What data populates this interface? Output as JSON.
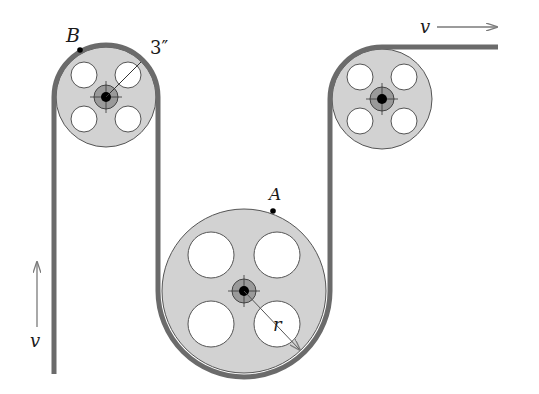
{
  "diagram": {
    "type": "belt-pulley-system",
    "labels": {
      "point_b": "B",
      "point_a": "A",
      "small_radius": "3″",
      "large_radius": "r",
      "velocity_out": "v",
      "velocity_in": "v"
    },
    "pulleys": [
      {
        "name": "top-left-pulley",
        "cx": 106,
        "cy": 97,
        "r": 50
      },
      {
        "name": "top-right-pulley",
        "cx": 382,
        "cy": 99,
        "r": 50
      },
      {
        "name": "large-bottom-pulley",
        "cx": 244,
        "cy": 291,
        "r": 82
      }
    ],
    "colors": {
      "belt": "#6b6b6b",
      "pulley_fill": "#d2d2d2",
      "hub_fill": "#9a9a9a",
      "outline": "#555555",
      "arrow": "#7a7a7a"
    }
  }
}
